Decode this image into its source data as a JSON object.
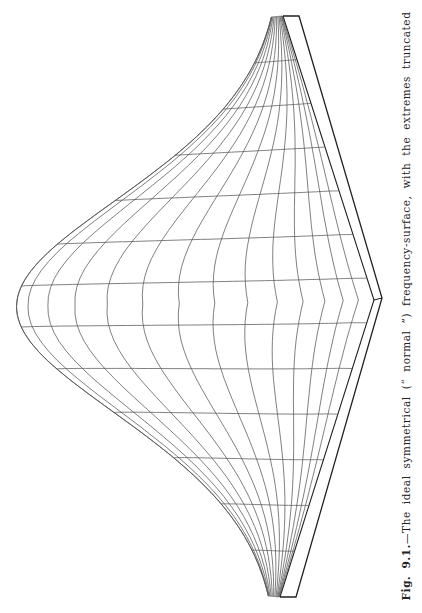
{
  "figure": {
    "label": "Fig. 9.1.",
    "caption_text": "—The ideal symmetrical (“ normal ”) frequency-surface, with the extremes truncated",
    "colors": {
      "line": "#555555",
      "base": "#222222",
      "background": "#ffffff"
    }
  },
  "chart_data": {
    "type": "surface",
    "title": "The ideal symmetrical (“ normal ”) frequency-surface, with the extremes truncated",
    "surface": "bivariate normal",
    "grid": {
      "u_lines": 13,
      "v_lines": 13
    },
    "base": {
      "top_corner": [
        291,
        16
      ],
      "right_corner": [
        378,
        300
      ],
      "bottom_corner": [
        288,
        597
      ],
      "left_corner": [
        200,
        306
      ],
      "slab_thickness": 8
    },
    "peak_point": [
      19,
      258
    ],
    "truncated_extremes": true
  }
}
